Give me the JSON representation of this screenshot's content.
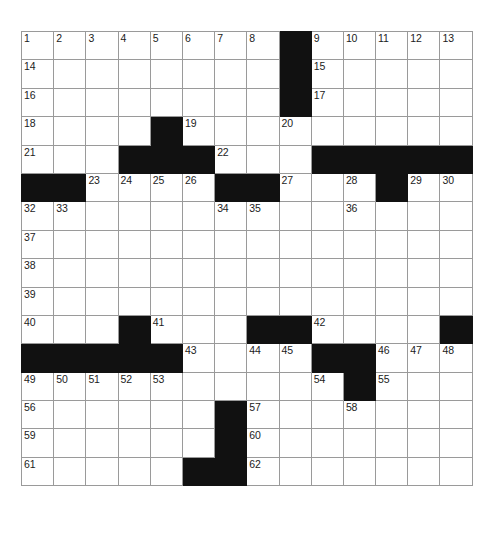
{
  "puzzle": {
    "title": "Crossword Puzzle Grid",
    "rows": 18,
    "columns": 14,
    "cell_size_px": 32,
    "colors": {
      "block": "#111111",
      "grid_line": "#9a9a9a",
      "background": "#ffffff",
      "number_text": "#1b1b1b"
    },
    "numbers_present": [
      1,
      2,
      3,
      4,
      5,
      6,
      7,
      8,
      9,
      10,
      11,
      12,
      13,
      14,
      15,
      16,
      17,
      18,
      19,
      20,
      21,
      22,
      23,
      24,
      25,
      26,
      27,
      28,
      29,
      30,
      31,
      32,
      33,
      34,
      35,
      36,
      37,
      38,
      39,
      40,
      41,
      42,
      43,
      44,
      45,
      46,
      47,
      48,
      49,
      50,
      51,
      52,
      53,
      54,
      55,
      56,
      57,
      58,
      59,
      60,
      61,
      62
    ],
    "grid": [
      [
        {
          "type": "open",
          "number": "1"
        },
        {
          "type": "open",
          "number": "2"
        },
        {
          "type": "open",
          "number": "3"
        },
        {
          "type": "open",
          "number": "4"
        },
        {
          "type": "open",
          "number": "5"
        },
        {
          "type": "open",
          "number": "6"
        },
        {
          "type": "open",
          "number": "7"
        },
        {
          "type": "open",
          "number": "8"
        },
        {
          "type": "block",
          "number": ""
        },
        {
          "type": "open",
          "number": "9"
        },
        {
          "type": "open",
          "number": "10"
        },
        {
          "type": "open",
          "number": "11"
        },
        {
          "type": "open",
          "number": "12"
        },
        {
          "type": "open",
          "number": "13"
        }
      ],
      [
        {
          "type": "open",
          "number": "14"
        },
        {
          "type": "open",
          "number": ""
        },
        {
          "type": "open",
          "number": ""
        },
        {
          "type": "open",
          "number": ""
        },
        {
          "type": "open",
          "number": ""
        },
        {
          "type": "open",
          "number": ""
        },
        {
          "type": "open",
          "number": ""
        },
        {
          "type": "open",
          "number": ""
        },
        {
          "type": "block",
          "number": ""
        },
        {
          "type": "open",
          "number": "15"
        },
        {
          "type": "open",
          "number": ""
        },
        {
          "type": "open",
          "number": ""
        },
        {
          "type": "open",
          "number": ""
        },
        {
          "type": "open",
          "number": ""
        }
      ],
      [
        {
          "type": "open",
          "number": "16"
        },
        {
          "type": "open",
          "number": ""
        },
        {
          "type": "open",
          "number": ""
        },
        {
          "type": "open",
          "number": ""
        },
        {
          "type": "open",
          "number": ""
        },
        {
          "type": "open",
          "number": ""
        },
        {
          "type": "open",
          "number": ""
        },
        {
          "type": "open",
          "number": ""
        },
        {
          "type": "block",
          "number": ""
        },
        {
          "type": "open",
          "number": "17"
        },
        {
          "type": "open",
          "number": ""
        },
        {
          "type": "open",
          "number": ""
        },
        {
          "type": "open",
          "number": ""
        },
        {
          "type": "open",
          "number": ""
        }
      ],
      [
        {
          "type": "open",
          "number": "18"
        },
        {
          "type": "open",
          "number": ""
        },
        {
          "type": "open",
          "number": ""
        },
        {
          "type": "open",
          "number": ""
        },
        {
          "type": "block",
          "number": ""
        },
        {
          "type": "open",
          "number": "19"
        },
        {
          "type": "open",
          "number": ""
        },
        {
          "type": "open",
          "number": ""
        },
        {
          "type": "open",
          "number": "20"
        },
        {
          "type": "open",
          "number": ""
        },
        {
          "type": "open",
          "number": ""
        },
        {
          "type": "open",
          "number": ""
        },
        {
          "type": "open",
          "number": ""
        },
        {
          "type": "open",
          "number": ""
        }
      ],
      [
        {
          "type": "open",
          "number": "21"
        },
        {
          "type": "open",
          "number": ""
        },
        {
          "type": "open",
          "number": ""
        },
        {
          "type": "block",
          "number": ""
        },
        {
          "type": "block",
          "number": ""
        },
        {
          "type": "block",
          "number": ""
        },
        {
          "type": "open",
          "number": "22"
        },
        {
          "type": "open",
          "number": ""
        },
        {
          "type": "open",
          "number": ""
        },
        {
          "type": "block",
          "number": ""
        },
        {
          "type": "block",
          "number": ""
        },
        {
          "type": "block",
          "number": ""
        },
        {
          "type": "block",
          "number": ""
        },
        {
          "type": "block",
          "number": ""
        }
      ],
      [
        {
          "type": "block",
          "number": ""
        },
        {
          "type": "block",
          "number": ""
        },
        {
          "type": "open",
          "number": "23"
        },
        {
          "type": "open",
          "number": "24"
        },
        {
          "type": "open",
          "number": "25"
        },
        {
          "type": "open",
          "number": "26"
        },
        {
          "type": "block",
          "number": ""
        },
        {
          "type": "block",
          "number": ""
        },
        {
          "type": "open",
          "number": "27"
        },
        {
          "type": "open",
          "number": ""
        },
        {
          "type": "open",
          "number": "28"
        },
        {
          "type": "block",
          "number": ""
        },
        {
          "type": "open",
          "number": "29"
        },
        {
          "type": "open",
          "number": "30"
        }
      ],
      [
        {
          "type": "open",
          "number": "32"
        },
        {
          "type": "open",
          "number": "33"
        },
        {
          "type": "open",
          "number": ""
        },
        {
          "type": "open",
          "number": ""
        },
        {
          "type": "open",
          "number": ""
        },
        {
          "type": "open",
          "number": ""
        },
        {
          "type": "open",
          "number": "34"
        },
        {
          "type": "open",
          "number": "35"
        },
        {
          "type": "open",
          "number": ""
        },
        {
          "type": "open",
          "number": ""
        },
        {
          "type": "open",
          "number": "36"
        },
        {
          "type": "open",
          "number": ""
        },
        {
          "type": "open",
          "number": ""
        },
        {
          "type": "open",
          "number": ""
        }
      ],
      [
        {
          "type": "open",
          "number": "37"
        },
        {
          "type": "open",
          "number": ""
        },
        {
          "type": "open",
          "number": ""
        },
        {
          "type": "open",
          "number": ""
        },
        {
          "type": "open",
          "number": ""
        },
        {
          "type": "open",
          "number": ""
        },
        {
          "type": "open",
          "number": ""
        },
        {
          "type": "open",
          "number": ""
        },
        {
          "type": "open",
          "number": ""
        },
        {
          "type": "open",
          "number": ""
        },
        {
          "type": "open",
          "number": ""
        },
        {
          "type": "open",
          "number": ""
        },
        {
          "type": "open",
          "number": ""
        },
        {
          "type": "open",
          "number": ""
        }
      ],
      [
        {
          "type": "open",
          "number": "38"
        },
        {
          "type": "open",
          "number": ""
        },
        {
          "type": "open",
          "number": ""
        },
        {
          "type": "open",
          "number": ""
        },
        {
          "type": "open",
          "number": ""
        },
        {
          "type": "open",
          "number": ""
        },
        {
          "type": "open",
          "number": ""
        },
        {
          "type": "open",
          "number": ""
        },
        {
          "type": "open",
          "number": ""
        },
        {
          "type": "open",
          "number": ""
        },
        {
          "type": "open",
          "number": ""
        },
        {
          "type": "open",
          "number": ""
        },
        {
          "type": "open",
          "number": ""
        },
        {
          "type": "open",
          "number": ""
        }
      ],
      [
        {
          "type": "open",
          "number": "39"
        },
        {
          "type": "open",
          "number": ""
        },
        {
          "type": "open",
          "number": ""
        },
        {
          "type": "open",
          "number": ""
        },
        {
          "type": "open",
          "number": ""
        },
        {
          "type": "open",
          "number": ""
        },
        {
          "type": "open",
          "number": ""
        },
        {
          "type": "open",
          "number": ""
        },
        {
          "type": "open",
          "number": ""
        },
        {
          "type": "open",
          "number": ""
        },
        {
          "type": "open",
          "number": ""
        },
        {
          "type": "open",
          "number": ""
        },
        {
          "type": "open",
          "number": ""
        },
        {
          "type": "open",
          "number": ""
        }
      ],
      [
        {
          "type": "open",
          "number": "40"
        },
        {
          "type": "open",
          "number": ""
        },
        {
          "type": "open",
          "number": ""
        },
        {
          "type": "block",
          "number": ""
        },
        {
          "type": "open",
          "number": "41"
        },
        {
          "type": "open",
          "number": ""
        },
        {
          "type": "open",
          "number": ""
        },
        {
          "type": "block",
          "number": ""
        },
        {
          "type": "block",
          "number": ""
        },
        {
          "type": "open",
          "number": "42"
        },
        {
          "type": "open",
          "number": ""
        },
        {
          "type": "open",
          "number": ""
        },
        {
          "type": "open",
          "number": ""
        },
        {
          "type": "block",
          "number": ""
        }
      ],
      [
        {
          "type": "block",
          "number": ""
        },
        {
          "type": "block",
          "number": ""
        },
        {
          "type": "block",
          "number": ""
        },
        {
          "type": "block",
          "number": ""
        },
        {
          "type": "block",
          "number": ""
        },
        {
          "type": "open",
          "number": "43"
        },
        {
          "type": "open",
          "number": ""
        },
        {
          "type": "open",
          "number": "44"
        },
        {
          "type": "open",
          "number": "45"
        },
        {
          "type": "block",
          "number": ""
        },
        {
          "type": "block",
          "number": ""
        },
        {
          "type": "open",
          "number": "46"
        },
        {
          "type": "open",
          "number": "47"
        },
        {
          "type": "open",
          "number": "48"
        }
      ],
      [
        {
          "type": "open",
          "number": "49"
        },
        {
          "type": "open",
          "number": "50"
        },
        {
          "type": "open",
          "number": "51"
        },
        {
          "type": "open",
          "number": "52"
        },
        {
          "type": "open",
          "number": "53"
        },
        {
          "type": "open",
          "number": ""
        },
        {
          "type": "open",
          "number": ""
        },
        {
          "type": "open",
          "number": ""
        },
        {
          "type": "open",
          "number": ""
        },
        {
          "type": "open",
          "number": "54"
        },
        {
          "type": "block",
          "number": ""
        },
        {
          "type": "open",
          "number": "55"
        },
        {
          "type": "open",
          "number": ""
        },
        {
          "type": "open",
          "number": ""
        }
      ],
      [
        {
          "type": "open",
          "number": "56"
        },
        {
          "type": "open",
          "number": ""
        },
        {
          "type": "open",
          "number": ""
        },
        {
          "type": "open",
          "number": ""
        },
        {
          "type": "open",
          "number": ""
        },
        {
          "type": "open",
          "number": ""
        },
        {
          "type": "block",
          "number": ""
        },
        {
          "type": "open",
          "number": "57"
        },
        {
          "type": "open",
          "number": ""
        },
        {
          "type": "open",
          "number": ""
        },
        {
          "type": "open",
          "number": "58"
        },
        {
          "type": "open",
          "number": ""
        },
        {
          "type": "open",
          "number": ""
        },
        {
          "type": "open",
          "number": ""
        }
      ],
      [
        {
          "type": "open",
          "number": "59"
        },
        {
          "type": "open",
          "number": ""
        },
        {
          "type": "open",
          "number": ""
        },
        {
          "type": "open",
          "number": ""
        },
        {
          "type": "open",
          "number": ""
        },
        {
          "type": "open",
          "number": ""
        },
        {
          "type": "block",
          "number": ""
        },
        {
          "type": "open",
          "number": "60"
        },
        {
          "type": "open",
          "number": ""
        },
        {
          "type": "open",
          "number": ""
        },
        {
          "type": "open",
          "number": ""
        },
        {
          "type": "open",
          "number": ""
        },
        {
          "type": "open",
          "number": ""
        },
        {
          "type": "open",
          "number": ""
        }
      ],
      [
        {
          "type": "open",
          "number": "61"
        },
        {
          "type": "open",
          "number": ""
        },
        {
          "type": "open",
          "number": ""
        },
        {
          "type": "open",
          "number": ""
        },
        {
          "type": "open",
          "number": ""
        },
        {
          "type": "block",
          "number": ""
        },
        {
          "type": "block",
          "number": ""
        },
        {
          "type": "open",
          "number": "62"
        },
        {
          "type": "open",
          "number": ""
        },
        {
          "type": "open",
          "number": ""
        },
        {
          "type": "open",
          "number": ""
        },
        {
          "type": "open",
          "number": ""
        },
        {
          "type": "open",
          "number": ""
        },
        {
          "type": "open",
          "number": ""
        }
      ]
    ],
    "extra_row5_tail": [
      {
        "type": "open",
        "number": "31"
      }
    ]
  }
}
